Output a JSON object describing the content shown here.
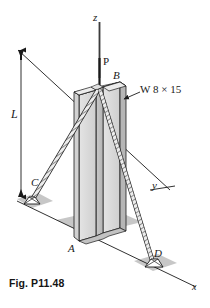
{
  "figure": {
    "caption": "Fig. P11.48",
    "type": "engineering-mechanics-diagram",
    "background_color": "#ffffff",
    "line_color": "#1a1a1a"
  },
  "axes": {
    "z_label": "z",
    "y_label": "y",
    "x_label": "x"
  },
  "labels": {
    "load": "P",
    "length": "L",
    "point_a": "A",
    "point_b": "B",
    "point_c": "C",
    "point_d": "D",
    "section": "W 8 × 15"
  },
  "colors": {
    "flange_light": "#dcdcdc",
    "flange_mid": "#c6c6c6",
    "web_dark": "#b0b0b0",
    "base_plate": "#bdbdbd",
    "cable_fill": "#e8e8e8",
    "outline": "#1a1a1a"
  }
}
